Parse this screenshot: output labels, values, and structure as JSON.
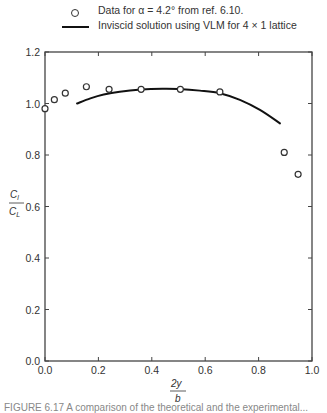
{
  "legend": {
    "items": [
      {
        "marker": "open-circle",
        "label": "Data for α = 4.2°  from ref. 6.10."
      },
      {
        "marker": "solid-line",
        "label": "Inviscid solution using VLM for 4 × 1 lattice"
      }
    ]
  },
  "axes": {
    "x_label_num": "2y",
    "x_label_den": "b",
    "y_label_num": "C",
    "y_label_num_sub": "l",
    "y_label_den": "C",
    "y_label_den_sub": "L"
  },
  "caption": "FIGURE 6.17  A comparison of the theoretical and the experimental...",
  "chart_data": {
    "type": "scatter+line",
    "title": "",
    "xlabel": "2y/b",
    "ylabel": "Cl/CL",
    "xlim": [
      0.0,
      1.0
    ],
    "ylim": [
      0.0,
      1.2
    ],
    "x_ticks": [
      "0.0",
      "0.2",
      "0.4",
      "0.6",
      "0.8",
      "1.0"
    ],
    "y_ticks": [
      "0.0",
      "0.2",
      "0.4",
      "0.6",
      "0.8",
      "1.0",
      "1.2"
    ],
    "grid": false,
    "legend_position": "top",
    "series": [
      {
        "name": "Data for α = 4.2° from ref. 6.10.",
        "type": "scatter",
        "marker": "open-circle",
        "x": [
          0.0,
          0.035,
          0.076,
          0.155,
          0.24,
          0.36,
          0.507,
          0.655,
          0.896,
          0.948
        ],
        "y": [
          0.98,
          1.015,
          1.04,
          1.065,
          1.055,
          1.055,
          1.055,
          1.045,
          0.81,
          0.725
        ]
      },
      {
        "name": "Inviscid solution using VLM for 4 × 1 lattice",
        "type": "line",
        "x": [
          0.12,
          0.17,
          0.22,
          0.28,
          0.36,
          0.44,
          0.5,
          0.58,
          0.655,
          0.73,
          0.805,
          0.88
        ],
        "y": [
          1.0,
          1.02,
          1.035,
          1.046,
          1.054,
          1.057,
          1.056,
          1.05,
          1.04,
          1.014,
          0.975,
          0.923
        ]
      }
    ]
  }
}
